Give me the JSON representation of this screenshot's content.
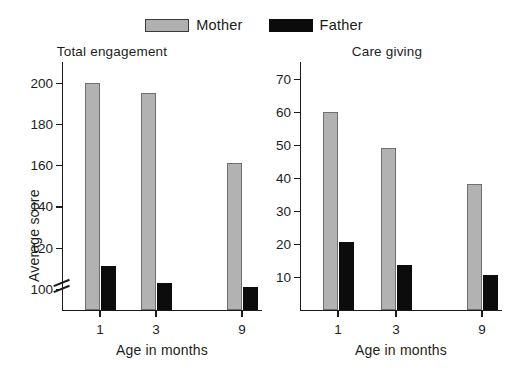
{
  "legend": {
    "entries": [
      {
        "label": "Mother",
        "color": "#b2b2b2",
        "swatch": "mother"
      },
      {
        "label": "Father",
        "color": "#0c0c0c",
        "swatch": "father"
      }
    ]
  },
  "charts": {
    "left": {
      "title": "Total engagement",
      "xlabel": "Age in months",
      "ylabel": "Average score",
      "yticks": [
        "100",
        "120",
        "140",
        "160",
        "180",
        "200"
      ],
      "xticks": [
        "1",
        "3",
        "9"
      ]
    },
    "right": {
      "title": "Care giving",
      "xlabel": "Age in months",
      "ylabel": "",
      "yticks": [
        "10",
        "20",
        "30",
        "40",
        "50",
        "60",
        "70"
      ],
      "xticks": [
        "1",
        "3",
        "9"
      ]
    }
  },
  "chart_data": [
    {
      "type": "bar",
      "title": "Total engagement",
      "xlabel": "Age in months",
      "ylabel": "Average score",
      "categories": [
        "1",
        "3",
        "9"
      ],
      "ylim": [
        90,
        210
      ],
      "yticks": [
        100,
        120,
        140,
        160,
        180,
        200
      ],
      "axis_break": true,
      "axis_break_note": "y-axis broken below 100",
      "grid": false,
      "legend_position": "top-center",
      "series": [
        {
          "name": "Mother",
          "color": "#b2b2b2",
          "values": [
            200,
            195,
            161
          ]
        },
        {
          "name": "Father",
          "color": "#0c0c0c",
          "values": [
            111,
            103,
            101
          ]
        }
      ]
    },
    {
      "type": "bar",
      "title": "Care giving",
      "xlabel": "Age in months",
      "ylabel": "",
      "categories": [
        "1",
        "3",
        "9"
      ],
      "ylim": [
        0,
        75
      ],
      "yticks": [
        10,
        20,
        30,
        40,
        50,
        60,
        70
      ],
      "axis_break": false,
      "grid": false,
      "legend_position": "top-center",
      "series": [
        {
          "name": "Mother",
          "color": "#b2b2b2",
          "values": [
            60,
            49,
            38
          ]
        },
        {
          "name": "Father",
          "color": "#0c0c0c",
          "values": [
            20.5,
            13.5,
            10.5
          ]
        }
      ]
    }
  ]
}
